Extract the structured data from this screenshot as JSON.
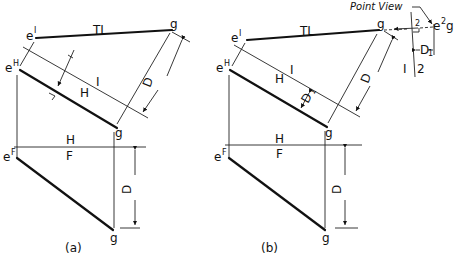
{
  "figure_a": {
    "caption": "(a)",
    "labels": {
      "e1": "e",
      "e1_sup": "I",
      "eH": "e",
      "eH_sup": "H",
      "eF": "e",
      "eF_sup": "F",
      "g_top": "g",
      "g_mid": "g",
      "g_bot": "g",
      "TL": "TL",
      "fold_H1_H": "H",
      "fold_H1_1": "I",
      "fold_HF_H": "H",
      "fold_HF_F": "F",
      "dim_D_aux": "D",
      "dim_D_front": "D"
    }
  },
  "figure_b": {
    "caption": "(b)",
    "labels": {
      "e1": "e",
      "e1_sup": "I",
      "eH": "e",
      "eH_sup": "H",
      "eF": "e",
      "eF_sup": "F",
      "g_top": "g",
      "g_mid": "g",
      "g_bot": "g",
      "TL": "TL",
      "fold_H1_H": "H",
      "fold_H1_1": "I",
      "fold_HF_H": "H",
      "fold_HF_F": "F",
      "fold_12_1": "I",
      "fold_12_2": "2",
      "dim_D_aux": "D",
      "dim_D1": "D",
      "dim_D1_sub": "1",
      "dim_D1_right": "D",
      "dim_D1_right_sub": "1",
      "dim_D_front": "D",
      "point_view_label": "Point View",
      "e2g": "e",
      "e2g_sup": "2",
      "e2g_g": "g",
      "right_angle_sup": "2"
    }
  }
}
